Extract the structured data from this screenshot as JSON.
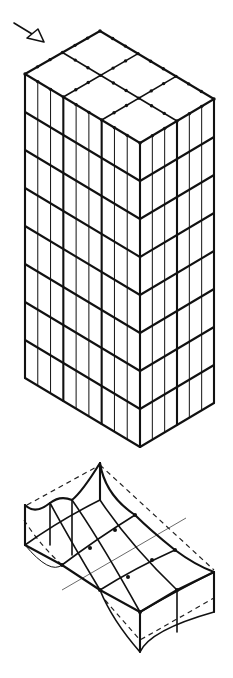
{
  "figure": {
    "colors": {
      "ink": "#111111",
      "background": "#ffffff"
    },
    "tower": {
      "top_vertices": {
        "back": [
          100,
          31
        ],
        "left": [
          25,
          74
        ],
        "front": [
          140,
          143
        ],
        "right": [
          214,
          99
        ]
      },
      "bottom_vertices": {
        "left": [
          25,
          379
        ],
        "front": [
          140,
          447
        ],
        "right": [
          214,
          403
        ]
      },
      "left_face_columns": 9,
      "right_face_columns": 6,
      "floors": 8,
      "roof_grid": {
        "along_left_edge": 3,
        "along_right_edge": 2
      }
    },
    "arrow": {
      "from": [
        14,
        23
      ],
      "to": [
        45,
        42
      ],
      "icon": "load-arrow-icon"
    },
    "slab": {
      "label": "deformed-floor-slab"
    }
  }
}
